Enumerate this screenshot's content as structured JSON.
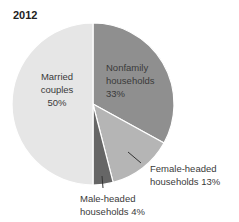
{
  "chart_data": {
    "type": "pie",
    "title": "2012",
    "categories": [
      "Married couples",
      "Nonfamily households",
      "Female-headed households",
      "Male-headed households"
    ],
    "values": [
      50,
      33,
      13,
      4
    ],
    "units": "%",
    "colors": [
      "#e6e6e6",
      "#8f8f8f",
      "#b5b5b5",
      "#666666"
    ],
    "labels": [
      {
        "line1": "Married",
        "line2": "couples",
        "line3": "50%"
      },
      {
        "line1": "Nonfamily",
        "line2": "households",
        "line3": "33%"
      },
      {
        "line1": "Female-headed",
        "line2": "households 13%"
      },
      {
        "line1": "Male-headed",
        "line2": "households 4%"
      }
    ],
    "start_angle_deg": 0,
    "direction": "clockwise",
    "legend": "none (direct labels)"
  }
}
